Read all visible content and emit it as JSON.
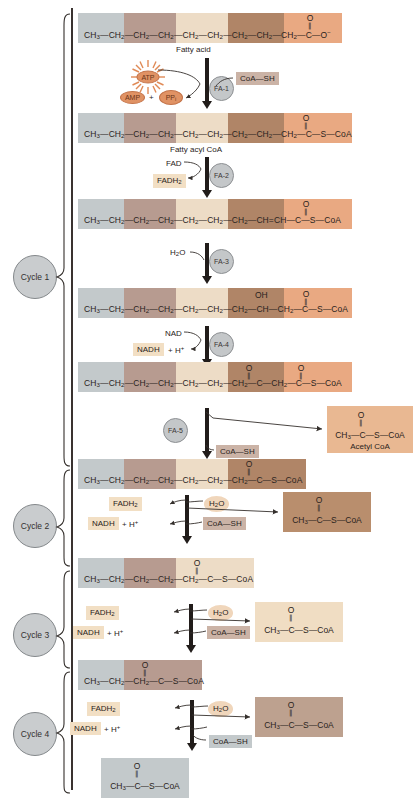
{
  "figure": {
    "colors": {
      "band_gray": "#c3c9cb",
      "band_mauve": "#b79b90",
      "band_cream": "#eddcc6",
      "band_brown": "#b08567",
      "band_salmon": "#e9a982",
      "enzyme_fill": "#c4c7c9",
      "cycle_fill": "#c9ccce",
      "atp_orange": "#e09264",
      "ink": "#2a2320"
    }
  },
  "cycles": [
    {
      "id": "cycle-1",
      "label": "Cycle 1"
    },
    {
      "id": "cycle-2",
      "label": "Cycle 2"
    },
    {
      "id": "cycle-3",
      "label": "Cycle 3"
    },
    {
      "id": "cycle-4",
      "label": "Cycle 4"
    }
  ],
  "enzymes": [
    {
      "id": "fa-1",
      "label": "FA-1"
    },
    {
      "id": "fa-2",
      "label": "FA-2"
    },
    {
      "id": "fa-3",
      "label": "FA-3"
    },
    {
      "id": "fa-4",
      "label": "FA-4"
    },
    {
      "id": "fa-5",
      "label": "FA-5"
    }
  ],
  "molecules": {
    "fatty_acid": {
      "caption": "Fatty acid",
      "formula_html": "CH<sub>3</sub>&#8212;CH<sub>2</sub>&#8212;CH<sub>2</sub>&#8212;CH<sub>2</sub>&#8212;CH<sub>2</sub>&#8212;CH<sub>2</sub>&#8212;CH<sub>2</sub>&#8212;CH<sub>2</sub>&#8212;CH<sub>2</sub>&#8212;C&#8212;O<sup>&#8722;</sup>"
    },
    "fatty_acyl_coa": {
      "caption": "Fatty acyl CoA",
      "formula_html": "CH<sub>3</sub>&#8212;CH<sub>2</sub>&#8212;CH<sub>2</sub>&#8212;CH<sub>2</sub>&#8212;CH<sub>2</sub>&#8212;CH<sub>2</sub>&#8212;CH<sub>2</sub>&#8212;CH<sub>2</sub>&#8212;CH<sub>2</sub>&#8212;C&#8212;S&#8212;CoA"
    },
    "enoyl_coa": {
      "caption": "",
      "formula_html": "CH<sub>3</sub>&#8212;CH<sub>2</sub>&#8212;CH<sub>2</sub>&#8212;CH<sub>2</sub>&#8212;CH<sub>2</sub>&#8212;CH<sub>2</sub>&#8212;CH<sub>2</sub>&#8212;CH&#61;CH&#8212;C&#8212;S&#8212;CoA"
    },
    "hydroxyacyl_coa": {
      "caption": "",
      "oh_label": "OH",
      "formula_html": "CH<sub>3</sub>&#8212;CH<sub>2</sub>&#8212;CH<sub>2</sub>&#8212;CH<sub>2</sub>&#8212;CH<sub>2</sub>&#8212;CH<sub>2</sub>&#8212;CH<sub>2</sub>&#8212;CH&#8212;CH<sub>2</sub>&#8212;C&#8212;S&#8212;CoA"
    },
    "ketoacyl_coa": {
      "caption": "",
      "formula_html": "CH<sub>3</sub>&#8212;CH<sub>2</sub>&#8212;CH<sub>2</sub>&#8212;CH<sub>2</sub>&#8212;CH<sub>2</sub>&#8212;CH<sub>2</sub>&#8212;CH<sub>2</sub>&#8212;C&#8212;CH<sub>2</sub>&#8212;C&#8212;S&#8212;CoA"
    },
    "c14_acyl_coa": {
      "caption": "",
      "formula_html": "CH<sub>3</sub>&#8212;CH<sub>2</sub>&#8212;CH<sub>2</sub>&#8212;CH<sub>2</sub>&#8212;CH<sub>2</sub>&#8212;CH<sub>2</sub>&#8212;CH<sub>2</sub>&#8212;C&#8212;S&#8212;CoA"
    },
    "c12_acyl_coa": {
      "caption": "",
      "formula_html": "CH<sub>3</sub>&#8212;CH<sub>2</sub>&#8212;CH<sub>2</sub>&#8212;CH<sub>2</sub>&#8212;CH<sub>2</sub>&#8212;C&#8212;S&#8212;CoA"
    },
    "c10_acyl_coa": {
      "caption": "",
      "formula_html": "CH<sub>3</sub>&#8212;CH<sub>2</sub>&#8212;CH<sub>2</sub>&#8212;C&#8212;S&#8212;CoA"
    },
    "acetyl_coa_1": {
      "caption": "Acetyl CoA",
      "formula_html": "CH<sub>3</sub>&#8212;C&#8212;S&#8212;CoA"
    },
    "acetyl_coa_2": {
      "caption": "",
      "formula_html": "CH<sub>3</sub>&#8212;C&#8212;S&#8212;CoA"
    },
    "acetyl_coa_3": {
      "caption": "",
      "formula_html": "CH<sub>3</sub>&#8212;C&#8212;S&#8212;CoA"
    },
    "acetyl_coa_4": {
      "caption": "",
      "formula_html": "CH<sub>3</sub>&#8212;C&#8212;S&#8212;CoA"
    },
    "acetyl_coa_5": {
      "caption": "",
      "formula_html": "CH<sub>3</sub>&#8212;C&#8212;S&#8212;CoA"
    }
  },
  "cofactors": {
    "atp": "ATP",
    "amp": "AMP",
    "plus": "+",
    "ppi_html": "PP<sub>i</sub>",
    "coash_1": "CoA—SH",
    "coash_2": "CoA—SH",
    "coash_3": "CoA—SH",
    "coash_4": "CoA—SH",
    "coash_5": "CoA—SH",
    "fad": "FAD",
    "fadh2_1_html": "FADH<sub>2</sub>",
    "fadh2_2_html": "FADH<sub>2</sub>",
    "fadh2_3_html": "FADH<sub>2</sub>",
    "fadh2_4_html": "FADH<sub>2</sub>",
    "nad": "NAD",
    "nadh_1_html": "NADH",
    "nadh_plus_h_1_html": "&#43; H<sup>&#43;</sup>",
    "nadh_2_html": "NADH",
    "nadh_plus_h_2_html": "&#43; H<sup>&#43;</sup>",
    "nadh_3_html": "NADH",
    "nadh_plus_h_3_html": "&#43; H<sup>&#43;</sup>",
    "nadh_4_html": "NADH",
    "nadh_plus_h_4_html": "&#43; H<sup>&#43;</sup>",
    "water_1_html": "H<sub>2</sub>O",
    "water_2_html": "H<sub>2</sub>O",
    "water_3_html": "H<sub>2</sub>O",
    "water_4_html": "H<sub>2</sub>O",
    "oxygen": "O"
  }
}
